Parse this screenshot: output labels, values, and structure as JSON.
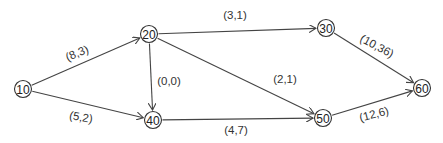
{
  "diagram": {
    "type": "network",
    "nodes": [
      {
        "id": "10",
        "label": "10",
        "x": 23,
        "y": 89
      },
      {
        "id": "20",
        "label": "20",
        "x": 149,
        "y": 34
      },
      {
        "id": "40",
        "label": "40",
        "x": 153,
        "y": 120
      },
      {
        "id": "30",
        "label": "30",
        "x": 326,
        "y": 28
      },
      {
        "id": "50",
        "label": "50",
        "x": 323,
        "y": 118
      },
      {
        "id": "60",
        "label": "60",
        "x": 422,
        "y": 88
      }
    ],
    "edges": [
      {
        "from": "10",
        "to": "20",
        "label": "(8,3)",
        "lx": 77,
        "ly": 53,
        "rot": -22
      },
      {
        "from": "10",
        "to": "40",
        "label": "(5,2)",
        "lx": 81,
        "ly": 117,
        "rot": 10
      },
      {
        "from": "20",
        "to": "40",
        "label": "(0,0)",
        "lx": 169,
        "ly": 81,
        "rot": 0
      },
      {
        "from": "20",
        "to": "30",
        "label": "(3,1)",
        "lx": 235,
        "ly": 15,
        "rot": 0
      },
      {
        "from": "20",
        "to": "50",
        "label": "(2,1)",
        "lx": 285,
        "ly": 79,
        "rot": 0
      },
      {
        "from": "40",
        "to": "50",
        "label": "(4,7)",
        "lx": 236,
        "ly": 130,
        "rot": 0
      },
      {
        "from": "30",
        "to": "60",
        "label": "(10,36)",
        "lx": 377,
        "ly": 46,
        "rot": 28
      },
      {
        "from": "50",
        "to": "60",
        "label": "(12,6)",
        "lx": 374,
        "ly": 114,
        "rot": -15
      }
    ]
  }
}
